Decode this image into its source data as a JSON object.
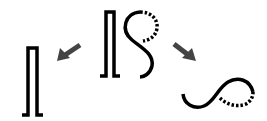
{
  "diagram": {
    "colors": {
      "stroke": "#000000",
      "arrow": "#444444",
      "background": "#ffffff"
    },
    "nodes": [
      {
        "id": "source",
        "label": "",
        "shape": "bracket-plus-s-curve",
        "position": "top-center"
      },
      {
        "id": "left-result",
        "label": "",
        "shape": "bracket",
        "position": "bottom-left"
      },
      {
        "id": "right-result",
        "label": "",
        "shape": "s-curve-horizontal",
        "position": "bottom-right"
      }
    ],
    "edges": [
      {
        "from": "source",
        "to": "left-result",
        "style": "thick-arrow",
        "direction": "down-left"
      },
      {
        "from": "source",
        "to": "right-result",
        "style": "thick-arrow",
        "direction": "down-right"
      }
    ]
  }
}
